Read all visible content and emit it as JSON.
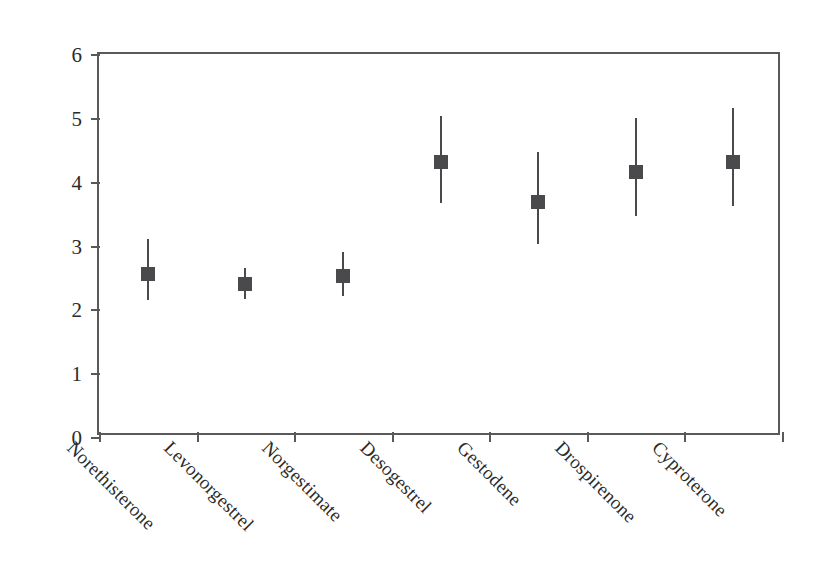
{
  "chart_data": {
    "type": "scatter",
    "subtype": "forest-plot-error-bars",
    "title": "",
    "xlabel": "",
    "ylabel": "Adjusted odds ratio (95% CI)",
    "ylim": [
      0,
      6
    ],
    "yticks": [
      0,
      1,
      2,
      3,
      4,
      5,
      6
    ],
    "ytick_labels": [
      "0",
      "1",
      "2",
      "3",
      "4",
      "5",
      "6"
    ],
    "grid": false,
    "legend": null,
    "categories": [
      "Norethisterone",
      "Levonorgestrel",
      "Norgestimate",
      "Desogestrel",
      "Gestodene",
      "Drospirenone",
      "Cyproterone"
    ],
    "values": [
      2.56,
      2.4,
      2.53,
      4.31,
      3.68,
      4.15,
      4.31
    ],
    "ci_low": [
      2.15,
      2.16,
      2.21,
      3.67,
      3.03,
      3.46,
      3.62
    ],
    "ci_high": [
      3.1,
      2.65,
      2.9,
      5.03,
      4.47,
      5.0,
      5.16
    ],
    "points": [
      {
        "label": "Norethisterone",
        "value": 2.56,
        "ci_low": 2.15,
        "ci_high": 3.1
      },
      {
        "label": "Levonorgestrel",
        "value": 2.4,
        "ci_low": 2.16,
        "ci_high": 2.65
      },
      {
        "label": "Norgestimate",
        "value": 2.53,
        "ci_low": 2.21,
        "ci_high": 2.9
      },
      {
        "label": "Desogestrel",
        "value": 4.31,
        "ci_low": 3.67,
        "ci_high": 5.03
      },
      {
        "label": "Gestodene",
        "value": 3.68,
        "ci_low": 3.03,
        "ci_high": 4.47
      },
      {
        "label": "Drospirenone",
        "value": 4.15,
        "ci_low": 3.46,
        "ci_high": 5.0
      },
      {
        "label": "Cyproterone",
        "value": 4.31,
        "ci_low": 3.62,
        "ci_high": 5.16
      }
    ],
    "marker_color": "#4a4a4c",
    "axis_color": "#59595b",
    "background_color": "#ffffff"
  }
}
